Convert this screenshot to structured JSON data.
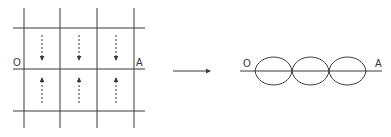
{
  "left_diagram": {
    "label_start": "O",
    "label_end": "A",
    "columns": 3,
    "rows": 2,
    "top_row_arrow_direction": "down",
    "bottom_row_arrow_direction": "up",
    "arrow_style": "dashed"
  },
  "transition_arrow": {
    "direction": "right"
  },
  "right_diagram": {
    "label_start": "O",
    "label_end": "A",
    "lobes": 3,
    "description": "standing wave envelope with 3 loops between O and A"
  },
  "colors": {
    "line": "#3a3a3a",
    "background": "#ffffff"
  }
}
